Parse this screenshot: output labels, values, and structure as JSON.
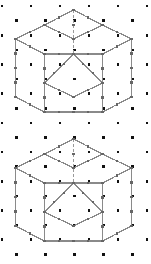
{
  "figure": {
    "background_color": "#ffffff",
    "width": 151,
    "height": 264,
    "panel_count": 2
  },
  "colors": {
    "dot": "#111111",
    "edge": "#8a8a8a",
    "hidden_edge": "#9a9a9a",
    "edge_tick": "#666666",
    "background": "#ffffff"
  },
  "grid": {
    "type": "triangular-isometric",
    "dot_size": 2.6,
    "column_spacing": 29,
    "row_spacing": 14.6,
    "row_offset": 14.5,
    "columns": 6,
    "rows": 19,
    "origin_x": 2,
    "origin_y": 6
  },
  "panels": [
    {
      "name": "panel-top",
      "label": "Cube 1",
      "origin_y": 0,
      "cube": {
        "name": "isometric-cube-top",
        "apex": [
          73.5,
          10
        ],
        "upper_left": [
          44.5,
          25
        ],
        "upper_right": [
          102.5,
          25
        ],
        "left_top": [
          15.5,
          39
        ],
        "right_top": [
          131.5,
          39
        ],
        "center": [
          73.5,
          54
        ],
        "left_bottom": [
          15.5,
          97
        ],
        "right_bottom": [
          131.5,
          97
        ],
        "lower_left": [
          44.5,
          112
        ],
        "lower_right": [
          102.5,
          112
        ],
        "center_bottom": [
          73.5,
          97
        ],
        "outline": "15.5,39 44.5,25 73.5,10 102.5,25 131.5,39 131.5,97 102.5,112 44.5,112 15.5,97",
        "interior_edges": [
          "44.5,25 73.5,39 102.5,25",
          "44.5,83 73.5,97 102.5,83",
          "15.5,39 44.5,54 44.5,112",
          "131.5,39 102.5,54 102.5,112",
          "73.5,54 44.5,83",
          "73.5,54 102.5,83",
          "44.5,54 102.5,54"
        ],
        "hidden_edge": "73.5,10 73.5,54",
        "hidden_edge_style": "dashed"
      }
    },
    {
      "name": "panel-bottom",
      "label": "Cube 2",
      "origin_y": 132,
      "cube": {
        "name": "isometric-cube-bottom",
        "apex": [
          73.5,
          139
        ],
        "upper_left": [
          44.5,
          154
        ],
        "upper_right": [
          102.5,
          154
        ],
        "left_top": [
          15.5,
          168
        ],
        "right_top": [
          131.5,
          168
        ],
        "center": [
          73.5,
          183
        ],
        "left_bottom": [
          15.5,
          226
        ],
        "right_bottom": [
          131.5,
          226
        ],
        "lower_left": [
          44.5,
          241
        ],
        "lower_right": [
          102.5,
          241
        ],
        "center_bottom": [
          73.5,
          226
        ],
        "outline": "15.5,168 44.5,154 73.5,139 102.5,154 131.5,168 131.5,226 102.5,241 44.5,241 15.5,226",
        "interior_edges": [
          "44.5,154 73.5,168 102.5,154",
          "44.5,212 73.5,226 102.5,212",
          "15.5,168 44.5,183 44.5,241",
          "131.5,168 102.5,183 102.5,241",
          "73.5,183 44.5,212",
          "73.5,183 102.5,212",
          "44.5,183 102.5,183"
        ],
        "hidden_edge": "73.5,139 73.5,183",
        "hidden_edge_style": "dashed"
      }
    }
  ]
}
